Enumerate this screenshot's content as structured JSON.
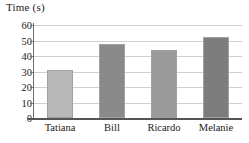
{
  "chart_data": {
    "type": "bar",
    "title": "Time (s)",
    "xlabel": "",
    "ylabel": "Time (s)",
    "categories": [
      "Tatiana",
      "Bill",
      "Ricardo",
      "Melanie"
    ],
    "values": [
      31,
      48,
      44,
      52
    ],
    "ylim": [
      0,
      60
    ],
    "yticks": [
      0,
      10,
      20,
      30,
      40,
      50,
      60
    ],
    "ytick_labels": [
      "0",
      "10",
      "20",
      "30",
      "40",
      "50",
      "60"
    ],
    "grid": true,
    "grid_axis": "y",
    "legend": false,
    "legend_position": "none",
    "bar_colors": [
      "#b8b8b8",
      "#8a8a8a",
      "#9a9a9a",
      "#7d7d7d"
    ],
    "bar_border_color": "#a0a0a0",
    "background_color": "#ffffff",
    "axis_color": "#555555",
    "gridline_color": "#cfcfcf",
    "text_color": "#1a1a1a",
    "bars": [
      {
        "label": "Tatiana",
        "value": 31,
        "color": "#b8b8b8"
      },
      {
        "label": "Bill",
        "value": 48,
        "color": "#8a8a8a"
      },
      {
        "label": "Ricardo",
        "value": 44,
        "color": "#9a9a9a"
      },
      {
        "label": "Melanie",
        "value": 52,
        "color": "#7d7d7d"
      }
    ]
  }
}
